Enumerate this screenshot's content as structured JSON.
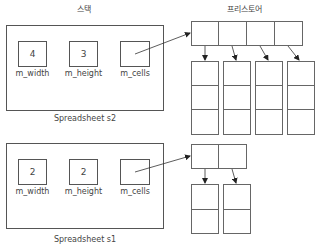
{
  "headers": {
    "stack": "스택",
    "freestore": "프리스토어"
  },
  "spreadsheets": [
    {
      "name": "Spreadsheet s2",
      "fields": [
        {
          "label": "m_width",
          "value": "4"
        },
        {
          "label": "m_height",
          "value": "3"
        },
        {
          "label": "m_cells",
          "value": ""
        }
      ],
      "heap": {
        "columns": 4,
        "rows_per_column": 3
      }
    },
    {
      "name": "Spreadsheet s1",
      "fields": [
        {
          "label": "m_width",
          "value": "2"
        },
        {
          "label": "m_height",
          "value": "2"
        },
        {
          "label": "m_cells",
          "value": ""
        }
      ],
      "heap": {
        "columns": 2,
        "rows_per_column": 2
      }
    }
  ],
  "colors": {
    "line": "#555555",
    "background": "#ffffff"
  }
}
